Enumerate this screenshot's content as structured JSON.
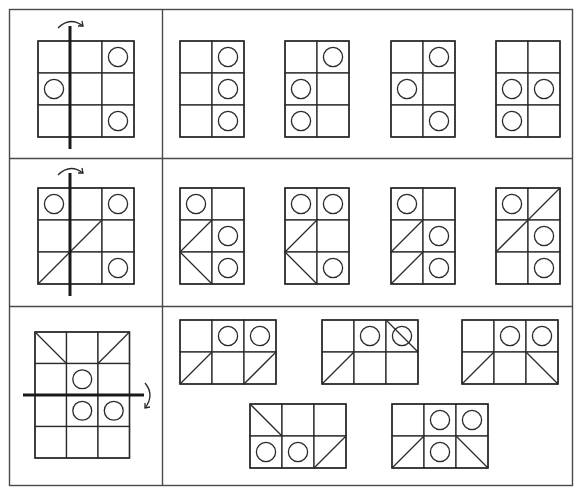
{
  "colors": {
    "line": "#2a2a2a",
    "frame": "#4a4a4a",
    "background": "#ffffff"
  },
  "rows": [
    {
      "question": {
        "grid": {
          "rows": 3,
          "cols": 3
        },
        "circles": [
          [
            0,
            2
          ],
          [
            1,
            0
          ],
          [
            2,
            2
          ]
        ],
        "diagonals": [],
        "fold": {
          "orientation": "vertical",
          "after_col": 1,
          "direction": "left-to-right",
          "arrow": "curved-arrow-right"
        }
      },
      "options": [
        {
          "grid": {
            "rows": 3,
            "cols": 2
          },
          "circles": [
            [
              0,
              1
            ],
            [
              1,
              1
            ],
            [
              2,
              1
            ]
          ],
          "diagonals": []
        },
        {
          "grid": {
            "rows": 3,
            "cols": 2
          },
          "circles": [
            [
              0,
              1
            ],
            [
              1,
              0
            ],
            [
              2,
              0
            ]
          ],
          "diagonals": []
        },
        {
          "grid": {
            "rows": 3,
            "cols": 2
          },
          "circles": [
            [
              0,
              1
            ],
            [
              1,
              0
            ],
            [
              2,
              1
            ]
          ],
          "diagonals": []
        },
        {
          "grid": {
            "rows": 3,
            "cols": 2
          },
          "circles": [
            [
              1,
              0
            ],
            [
              1,
              1
            ],
            [
              2,
              0
            ]
          ],
          "diagonals": []
        }
      ]
    },
    {
      "question": {
        "grid": {
          "rows": 3,
          "cols": 3
        },
        "circles": [
          [
            0,
            0
          ],
          [
            0,
            2
          ],
          [
            2,
            2
          ]
        ],
        "diagonals": [
          [
            1,
            1,
            "bl-tr"
          ],
          [
            2,
            0,
            "bl-tr"
          ]
        ],
        "fold": {
          "orientation": "vertical",
          "after_col": 1,
          "direction": "left-to-right",
          "arrow": "curved-arrow-right"
        }
      },
      "options": [
        {
          "grid": {
            "rows": 3,
            "cols": 2
          },
          "circles": [
            [
              0,
              0
            ],
            [
              1,
              1
            ],
            [
              2,
              1
            ]
          ],
          "diagonals": [
            [
              1,
              0,
              "bl-tr"
            ],
            [
              2,
              0,
              "tl-br"
            ]
          ]
        },
        {
          "grid": {
            "rows": 3,
            "cols": 2
          },
          "circles": [
            [
              0,
              0
            ],
            [
              0,
              1
            ],
            [
              2,
              1
            ]
          ],
          "diagonals": [
            [
              1,
              0,
              "bl-tr"
            ],
            [
              2,
              0,
              "tl-br"
            ]
          ]
        },
        {
          "grid": {
            "rows": 3,
            "cols": 2
          },
          "circles": [
            [
              0,
              0
            ],
            [
              1,
              1
            ],
            [
              2,
              1
            ]
          ],
          "diagonals": [
            [
              1,
              0,
              "bl-tr"
            ],
            [
              2,
              0,
              "bl-tr"
            ]
          ]
        },
        {
          "grid": {
            "rows": 3,
            "cols": 2
          },
          "circles": [
            [
              0,
              0
            ],
            [
              1,
              1
            ],
            [
              2,
              1
            ]
          ],
          "diagonals": [
            [
              0,
              1,
              "bl-tr"
            ],
            [
              1,
              0,
              "bl-tr"
            ]
          ]
        }
      ]
    },
    {
      "question": {
        "grid": {
          "rows": 4,
          "cols": 3
        },
        "circles": [
          [
            1,
            1
          ],
          [
            2,
            1
          ],
          [
            2,
            2
          ]
        ],
        "diagonals": [
          [
            0,
            0,
            "tl-br"
          ],
          [
            0,
            2,
            "bl-tr"
          ]
        ],
        "fold": {
          "orientation": "horizontal",
          "after_row": 1,
          "direction": "top-to-bottom",
          "arrow": "curved-arrow-down"
        }
      },
      "options": [
        {
          "grid": {
            "rows": 2,
            "cols": 3
          },
          "circles": [
            [
              0,
              1
            ],
            [
              0,
              2
            ]
          ],
          "diagonals": [
            [
              1,
              0,
              "bl-tr"
            ],
            [
              1,
              2,
              "bl-tr"
            ]
          ]
        },
        {
          "grid": {
            "rows": 2,
            "cols": 3
          },
          "circles": [
            [
              0,
              1
            ],
            [
              0,
              2
            ]
          ],
          "diagonals": [
            [
              0,
              2,
              "tl-br"
            ],
            [
              1,
              0,
              "bl-tr"
            ]
          ]
        },
        {
          "grid": {
            "rows": 2,
            "cols": 3
          },
          "circles": [
            [
              0,
              1
            ],
            [
              0,
              2
            ]
          ],
          "diagonals": [
            [
              1,
              0,
              "bl-tr"
            ],
            [
              1,
              2,
              "tl-br"
            ]
          ]
        },
        {
          "grid": {
            "rows": 2,
            "cols": 3
          },
          "circles": [
            [
              1,
              0
            ],
            [
              1,
              1
            ]
          ],
          "diagonals": [
            [
              0,
              0,
              "tl-br"
            ],
            [
              1,
              2,
              "bl-tr"
            ]
          ]
        },
        {
          "grid": {
            "rows": 2,
            "cols": 3
          },
          "circles": [
            [
              0,
              1
            ],
            [
              0,
              2
            ],
            [
              1,
              1
            ]
          ],
          "diagonals": [
            [
              1,
              0,
              "bl-tr"
            ],
            [
              1,
              2,
              "tl-br"
            ]
          ]
        }
      ]
    }
  ]
}
